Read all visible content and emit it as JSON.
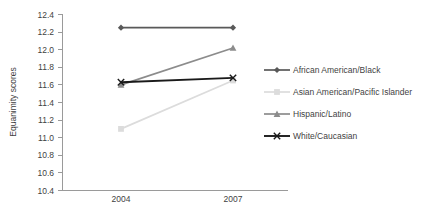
{
  "chart_data": {
    "type": "line",
    "title": "",
    "xlabel": "",
    "ylabel": "Equanimity scores",
    "categories": [
      "2004",
      "2007"
    ],
    "x": [
      2004,
      2007
    ],
    "ylim": [
      10.4,
      12.4
    ],
    "yticks": [
      "10.4",
      "10.6",
      "10.8",
      "11.0",
      "11.2",
      "11.4",
      "11.6",
      "11.8",
      "12.0",
      "12.2",
      "12.4"
    ],
    "ytick_values": [
      10.4,
      10.6,
      10.8,
      11.0,
      11.2,
      11.4,
      11.6,
      11.8,
      12.0,
      12.2,
      12.4
    ],
    "grid": false,
    "legend_position": "right",
    "series": [
      {
        "name": "African American/Black",
        "values": [
          12.25,
          12.25
        ],
        "color": "#595959",
        "marker": "diamond"
      },
      {
        "name": "Asian American/Pacific Islander",
        "values": [
          11.1,
          11.65
        ],
        "color": "#dcdcdc",
        "marker": "square"
      },
      {
        "name": "Hispanic/Latino",
        "values": [
          11.6,
          12.02
        ],
        "color": "#8c8c8c",
        "marker": "triangle"
      },
      {
        "name": "White/Caucasian",
        "values": [
          11.63,
          11.68
        ],
        "color": "#1a1a1a",
        "marker": "cross"
      }
    ]
  },
  "axis": {
    "y_title": "Equanimity scores",
    "y_tick_labels": [
      "12.4",
      "12.2",
      "12.0",
      "11.8",
      "11.6",
      "11.4",
      "11.2",
      "11.0",
      "10.8",
      "10.6",
      "10.4"
    ],
    "x_tick_labels": [
      "2004",
      "2007"
    ]
  },
  "legend": {
    "items": [
      {
        "label": "African American/Black"
      },
      {
        "label": "Asian American/Pacific Islander"
      },
      {
        "label": "Hispanic/Latino"
      },
      {
        "label": "White/Caucasian"
      }
    ]
  }
}
